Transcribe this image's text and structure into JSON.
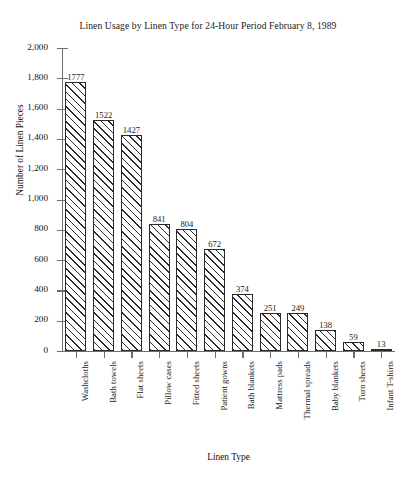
{
  "chart_data": {
    "type": "bar",
    "title": "Linen Usage by Linen Type for 24-Hour Period February 8, 1989",
    "xlabel": "Linen Type",
    "ylabel": "Number of Linen Pieces",
    "categories": [
      "Washcloths",
      "Bath towels",
      "Flat sheets",
      "Pillow cases",
      "Fitted sheets",
      "Patient gowns",
      "Bath blankets",
      "Mattress pads",
      "Thermal spreads",
      "Baby blankets",
      "Turn sheets",
      "Infant T-shirts"
    ],
    "values": [
      1777,
      1522,
      1427,
      841,
      804,
      672,
      374,
      251,
      249,
      138,
      59,
      13
    ],
    "ylim": [
      0,
      2000
    ],
    "ytick_labels": [
      "0",
      "200",
      "400",
      "600",
      "800",
      "1,000",
      "1,200",
      "1,400",
      "1,600",
      "1,800",
      "2,000"
    ],
    "ytick_values": [
      0,
      200,
      400,
      600,
      800,
      1000,
      1200,
      1400,
      1600,
      1800,
      2000
    ],
    "grid": false,
    "legend": "none",
    "data_labels_shown": true,
    "bar_fill": "diagonal-hatch",
    "colors": {
      "bar_outline": "#2a2a2a",
      "bar_fill": "#ffffff",
      "axis": "#6e6e6e",
      "text": "#1a1a1a",
      "background": "#ffffff"
    }
  }
}
